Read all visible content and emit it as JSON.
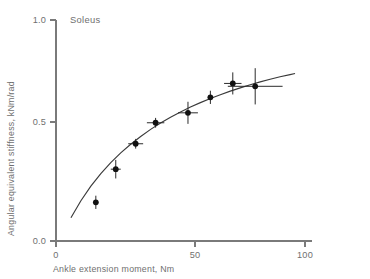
{
  "chart_data": {
    "type": "scatter",
    "title": "Soleus",
    "xlabel": "Ankle extension moment, Nm",
    "ylabel": "Angular equivalent stiffness, kNm/rad",
    "xlim": [
      0,
      100
    ],
    "ylim": [
      0.0,
      1.0
    ],
    "xticks": [
      0,
      50,
      100
    ],
    "xtick_labels": [
      "0",
      "50",
      "100"
    ],
    "yticks": [
      0.0,
      0.5,
      1.0
    ],
    "ytick_labels": [
      "0.0",
      "0.5",
      "1.0"
    ],
    "grid": false,
    "legend": "none",
    "points": [
      {
        "x": 16,
        "y": 0.175,
        "xerr": 0.0,
        "yerr": 0.03
      },
      {
        "x": 24,
        "y": 0.325,
        "xerr": 2.0,
        "yerr": 0.042
      },
      {
        "x": 32,
        "y": 0.44,
        "xerr": 3.0,
        "yerr": 0.022
      },
      {
        "x": 40,
        "y": 0.535,
        "xerr": 3.5,
        "yerr": 0.022
      },
      {
        "x": 53,
        "y": 0.58,
        "xerr": 4.0,
        "yerr": 0.05
      },
      {
        "x": 62,
        "y": 0.65,
        "xerr": 0.0,
        "yerr": 0.03
      },
      {
        "x": 71,
        "y": 0.713,
        "xerr": 3.5,
        "yerr": 0.05
      },
      {
        "x": 80,
        "y": 0.7,
        "xerr": 11.0,
        "yerr": 0.082
      }
    ],
    "fit_curve": {
      "description": "saturating curve through data",
      "x": [
        6,
        10,
        14,
        18,
        22,
        26,
        30,
        34,
        38,
        42,
        46,
        50,
        54,
        58,
        62,
        66,
        70,
        74,
        78,
        82,
        86,
        90,
        94,
        96
      ],
      "y": [
        0.105,
        0.182,
        0.248,
        0.305,
        0.355,
        0.399,
        0.438,
        0.473,
        0.505,
        0.534,
        0.56,
        0.584,
        0.606,
        0.626,
        0.645,
        0.662,
        0.678,
        0.693,
        0.707,
        0.72,
        0.732,
        0.743,
        0.753,
        0.758
      ]
    }
  },
  "colors": {
    "axis": "#7a7a7a",
    "curve": "#3a3a3a",
    "marker": "#111111",
    "text": "#6f6f6f",
    "background": "#ffffff"
  }
}
